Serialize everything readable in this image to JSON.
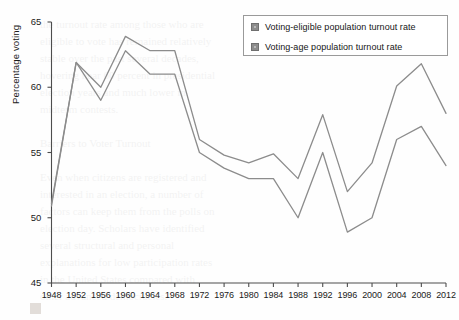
{
  "chart_data": {
    "type": "line",
    "title": "",
    "xlabel": "",
    "ylabel": "Percentage voting",
    "xlim": [
      1948,
      2012
    ],
    "ylim": [
      45,
      65
    ],
    "yticks": [
      45,
      50,
      55,
      60,
      65
    ],
    "grid": false,
    "legend_position": "top-right",
    "categories": [
      1948,
      1952,
      1956,
      1960,
      1964,
      1968,
      1972,
      1976,
      1980,
      1984,
      1988,
      1992,
      1996,
      2000,
      2004,
      2008,
      2012
    ],
    "xticklabels": [
      "1948",
      "1952",
      "1956",
      "1960",
      "1964",
      "1968",
      "1972",
      "1976",
      "1980",
      "1984",
      "1988",
      "1992",
      "1996",
      "2000",
      "2004",
      "2008",
      "2012"
    ],
    "yticklabels": [
      "45",
      "50",
      "55",
      "60",
      "65"
    ],
    "series": [
      {
        "name": "Voting-eligible population turnout rate",
        "color": "#8c8c8c",
        "values": [
          51.1,
          61.9,
          60.0,
          63.9,
          62.8,
          62.8,
          56.0,
          54.8,
          54.2,
          54.9,
          53.0,
          57.9,
          52.0,
          54.2,
          60.1,
          61.8,
          58.0
        ]
      },
      {
        "name": "Voting-age population turnout rate",
        "color": "#8c8c8c",
        "values": [
          50.9,
          61.9,
          59.0,
          62.8,
          61.0,
          61.0,
          55.0,
          53.8,
          53.0,
          53.0,
          50.0,
          55.0,
          48.9,
          50.0,
          56.0,
          57.0,
          54.0
        ]
      }
    ]
  },
  "legend": {
    "items": [
      {
        "label": "Voting-eligible population turnout rate"
      },
      {
        "label": "Voting-age population turnout rate"
      }
    ]
  },
  "axes": {
    "y_title": "Percentage voting"
  },
  "background_text": {
    "lines": [
      "the turnout rate among those who are",
      "eligible to vote has remained relatively",
      "stable over the past several decades,",
      "hovering near 60 percent in presidential",
      "election years and much lower in",
      "midterm contests.",
      "",
      "Barriers to Voter Turnout",
      "",
      "Even when citizens are registered and",
      "interested in an election, a number of",
      "factors can keep them from the polls on",
      "election day. Scholars have identified",
      "several structural and personal",
      "explanations for low participation rates",
      "in the United States compared with",
      "other advanced democracies."
    ]
  }
}
